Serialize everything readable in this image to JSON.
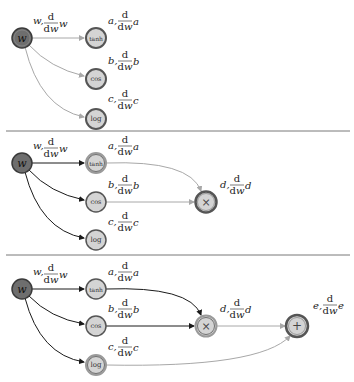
{
  "colors": {
    "background": "#ffffff",
    "input_node_fill": "#6e6e6e",
    "op_node_fill": "#d4d4d4",
    "active_ring": "#8a8a8a",
    "edge_active": "#1a1a1a",
    "edge_pending": "#a8a8a8",
    "divider": "#555555"
  },
  "panels": [
    {
      "nodes": [
        {
          "id": "w",
          "symbol": "w",
          "var": "w",
          "deriv_num": "d",
          "deriv_den": "dw",
          "deriv_var": "w"
        },
        {
          "id": "tanh",
          "symbol": "tanh",
          "var": "a",
          "deriv_num": "d",
          "deriv_den": "dw",
          "deriv_var": "a"
        },
        {
          "id": "cos",
          "symbol": "cos",
          "var": "b",
          "deriv_num": "d",
          "deriv_den": "dw",
          "deriv_var": "b"
        },
        {
          "id": "log",
          "symbol": "log",
          "var": "c",
          "deriv_num": "d",
          "deriv_den": "dw",
          "deriv_var": "c"
        }
      ]
    },
    {
      "nodes": [
        {
          "id": "w",
          "symbol": "w",
          "var": "w",
          "deriv_num": "d",
          "deriv_den": "dw",
          "deriv_var": "w"
        },
        {
          "id": "tanh",
          "symbol": "tanh",
          "var": "a",
          "deriv_num": "d",
          "deriv_den": "dw",
          "deriv_var": "a"
        },
        {
          "id": "cos",
          "symbol": "cos",
          "var": "b",
          "deriv_num": "d",
          "deriv_den": "dw",
          "deriv_var": "b"
        },
        {
          "id": "log",
          "symbol": "log",
          "var": "c",
          "deriv_num": "d",
          "deriv_den": "dw",
          "deriv_var": "c"
        },
        {
          "id": "mul",
          "symbol": "×",
          "var": "d",
          "deriv_num": "d",
          "deriv_den": "dw",
          "deriv_var": "d"
        }
      ]
    },
    {
      "nodes": [
        {
          "id": "w",
          "symbol": "w",
          "var": "w",
          "deriv_num": "d",
          "deriv_den": "dw",
          "deriv_var": "w"
        },
        {
          "id": "tanh",
          "symbol": "tanh",
          "var": "a",
          "deriv_num": "d",
          "deriv_den": "dw",
          "deriv_var": "a"
        },
        {
          "id": "cos",
          "symbol": "cos",
          "var": "b",
          "deriv_num": "d",
          "deriv_den": "dw",
          "deriv_var": "b"
        },
        {
          "id": "log",
          "symbol": "log",
          "var": "c",
          "deriv_num": "d",
          "deriv_den": "dw",
          "deriv_var": "c"
        },
        {
          "id": "mul",
          "symbol": "×",
          "var": "d",
          "deriv_num": "d",
          "deriv_den": "dw",
          "deriv_var": "d"
        },
        {
          "id": "add",
          "symbol": "+",
          "var": "e",
          "deriv_num": "d",
          "deriv_den": "dw",
          "deriv_var": "e"
        }
      ]
    }
  ]
}
